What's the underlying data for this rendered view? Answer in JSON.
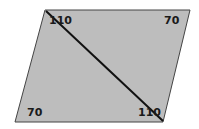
{
  "diagram": {
    "shape": "parallelogram",
    "fill": "#bdbdbd",
    "stroke": "#333333",
    "diagonal_color": "#111111",
    "angles": {
      "top_left": "110",
      "top_right": "70",
      "bottom_left": "70",
      "bottom_right": "110"
    }
  }
}
